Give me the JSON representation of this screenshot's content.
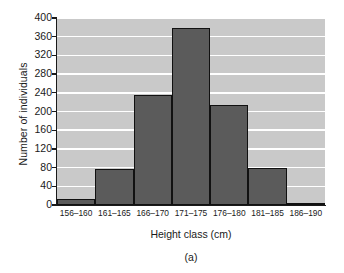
{
  "figure": {
    "caption": "(a)"
  },
  "chart_data": {
    "type": "bar",
    "title": "",
    "subtitle": "",
    "xlabel": "Height class (cm)",
    "ylabel": "Number of individuals",
    "categories": [
      "156–160",
      "161–165",
      "166–170",
      "171–175",
      "176–180",
      "181–185",
      "186–190"
    ],
    "values": [
      12,
      77,
      235,
      378,
      215,
      80,
      5
    ],
    "ylim": [
      0,
      400
    ],
    "yticks": [
      0,
      40,
      80,
      120,
      160,
      200,
      240,
      280,
      320,
      360,
      400
    ],
    "ytick_labels": [
      "0",
      "40",
      "80",
      "120",
      "160",
      "200",
      "240",
      "280",
      "320",
      "360",
      "400"
    ],
    "grid": "horizontal",
    "legend": "none",
    "bar_gap": 0,
    "colors": {
      "bar_fill": "#5b5b5b",
      "bar_edge": "#111111",
      "plot_background": "#c9c9c9",
      "gridline": "#ffffff",
      "axis": "#1a1a1a",
      "text": "#1a1a1a",
      "page_background": "#ffffff"
    }
  }
}
